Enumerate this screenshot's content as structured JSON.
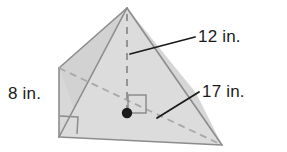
{
  "figure": {
    "kind": "geometry-diagram",
    "shape_name": "pyramid",
    "unit": "in.",
    "colors": {
      "face_light": "#dcdcdc",
      "face_mid": "#d2d2d2",
      "face_dark": "#c9c9c9",
      "edge": "#8c8c8c",
      "hidden_edge": "#a8a8a8",
      "leader": "#1b1b1b",
      "text": "#1b1b1b",
      "vertex_dot": "#1b1b1b",
      "background": "#ffffff"
    },
    "labels": {
      "height": "12 in.",
      "slant_or_base_edge": "17 in.",
      "left_edge": "8 in."
    },
    "markers": {
      "right_angle_base": "right-angle-square-at-altitude-foot",
      "right_angle_corner": "right-angle-square-at-bottom-left-corner",
      "center_point": "base-center-dot"
    },
    "geometry": {
      "apex": [
        127,
        8
      ],
      "back_left": [
        59,
        68
      ],
      "bottom_left": [
        59,
        137
      ],
      "right": [
        222,
        145
      ],
      "altitude_foot": [
        127,
        113
      ]
    }
  }
}
